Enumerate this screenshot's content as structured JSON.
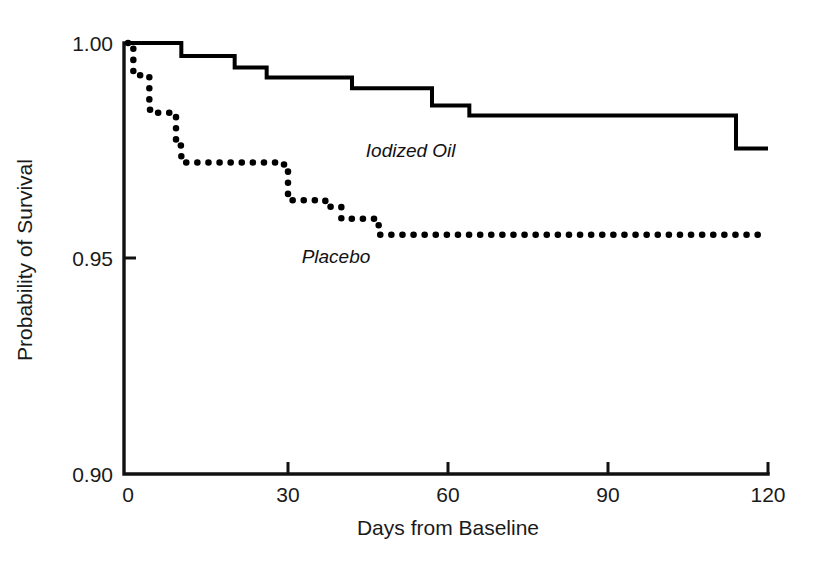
{
  "chart_data": {
    "type": "line",
    "subtype": "kaplan-meier-step",
    "title": "",
    "xlabel": "Days from Baseline",
    "ylabel": "Probability of Survival",
    "xlim": [
      0,
      120
    ],
    "ylim": [
      0.9,
      1.0
    ],
    "xticks": [
      0,
      30,
      60,
      90,
      120
    ],
    "xtick_labels": [
      "0",
      "30",
      "60",
      "90",
      "120"
    ],
    "yticks": [
      0.9,
      0.95,
      1.0
    ],
    "ytick_labels": [
      "0.90",
      "0.95",
      "1.00"
    ],
    "grid": false,
    "legend_position": "inline-annotations",
    "series": [
      {
        "name": "Iodized Oil",
        "style": "solid",
        "color": "#000000",
        "annotation": "Iodized Oil",
        "annotation_at": {
          "x": 53,
          "y": 0.9735
        },
        "x": [
          0,
          10,
          10,
          20,
          20,
          26,
          26,
          42,
          42,
          57,
          57,
          64,
          64,
          114,
          114,
          120
        ],
        "y": [
          1.0,
          1.0,
          0.997,
          0.997,
          0.9943,
          0.9943,
          0.992,
          0.992,
          0.9895,
          0.9895,
          0.9855,
          0.9855,
          0.9832,
          0.9832,
          0.9755,
          0.9755
        ]
      },
      {
        "name": "Placebo",
        "style": "dotted",
        "color": "#000000",
        "annotation": "Placebo",
        "annotation_at": {
          "x": 39,
          "y": 0.949
        },
        "x": [
          0,
          1,
          1,
          4,
          4,
          5,
          5,
          9,
          9,
          10,
          10,
          28,
          28,
          30,
          30,
          37,
          37,
          40,
          40,
          47,
          47,
          120
        ],
        "y": [
          1.0,
          1.0,
          0.9925,
          0.9925,
          0.9845,
          0.9845,
          0.9838,
          0.9838,
          0.9762,
          0.9762,
          0.9723,
          0.9723,
          0.9718,
          0.9718,
          0.9635,
          0.9635,
          0.962,
          0.962,
          0.9592,
          0.9592,
          0.9555,
          0.9555
        ]
      }
    ]
  },
  "axes": {
    "x_title": "Days from Baseline",
    "y_title": "Probability of Survival",
    "x_tick_0": "0",
    "x_tick_1": "30",
    "x_tick_2": "60",
    "x_tick_3": "90",
    "x_tick_4": "120",
    "y_tick_0": "1.00",
    "y_tick_1": "0.95",
    "y_tick_2": "0.90"
  },
  "annotations": {
    "iodized_oil": "Iodized Oil",
    "placebo": "Placebo"
  },
  "colors": {
    "ink": "#000000",
    "background": "#ffffff"
  }
}
